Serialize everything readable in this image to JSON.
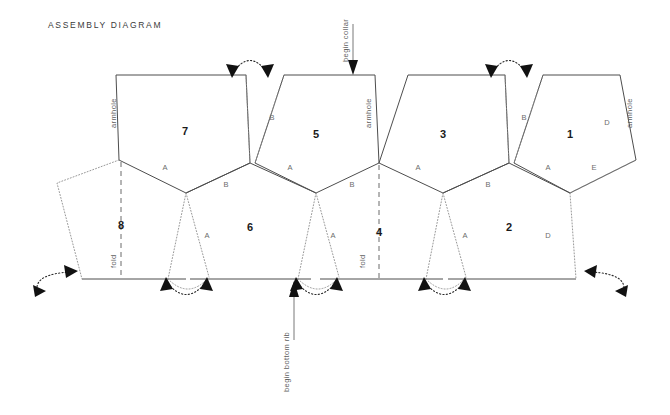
{
  "page": {
    "title": "ASSEMBLY DIAGRAM"
  },
  "colors": {
    "solid_edge": "#4d4d4d",
    "dotted_edge": "#8c8c8c",
    "fold_line": "#5a5a5a",
    "arrow": "#111111",
    "number_text": "#1a1a1a",
    "letter_text": "#6d6d6d",
    "annotation_text": "#5f5f5f",
    "background": "#ffffff"
  },
  "panels": [
    {
      "number": "1",
      "x": 570,
      "y": 135
    },
    {
      "number": "2",
      "x": 509,
      "y": 228
    },
    {
      "number": "3",
      "x": 443,
      "y": 135
    },
    {
      "number": "4",
      "x": 379,
      "y": 233
    },
    {
      "number": "5",
      "x": 316,
      "y": 135
    },
    {
      "number": "6",
      "x": 250,
      "y": 228
    },
    {
      "number": "7",
      "x": 185,
      "y": 132
    },
    {
      "number": "8",
      "x": 121,
      "y": 226
    }
  ],
  "edge_letters": [
    {
      "label": "A",
      "x": 165,
      "y": 168
    },
    {
      "label": "B",
      "x": 226,
      "y": 185
    },
    {
      "label": "A",
      "x": 207,
      "y": 236
    },
    {
      "label": "B",
      "x": 272,
      "y": 118
    },
    {
      "label": "A",
      "x": 290,
      "y": 168
    },
    {
      "label": "A",
      "x": 333,
      "y": 236
    },
    {
      "label": "B",
      "x": 352,
      "y": 185
    },
    {
      "label": "A",
      "x": 418,
      "y": 168
    },
    {
      "label": "B",
      "x": 488,
      "y": 185
    },
    {
      "label": "A",
      "x": 465,
      "y": 236
    },
    {
      "label": "B",
      "x": 524,
      "y": 118
    },
    {
      "label": "A",
      "x": 548,
      "y": 168
    },
    {
      "label": "E",
      "x": 594,
      "y": 168
    },
    {
      "label": "D",
      "x": 607,
      "y": 123
    },
    {
      "label": "D",
      "x": 548,
      "y": 236
    }
  ],
  "annotations": [
    {
      "name": "armhole-left",
      "label": "armhole",
      "x": 116,
      "y": 128,
      "rotation": -90
    },
    {
      "name": "armhole-center",
      "label": "armhole",
      "x": 371,
      "y": 128,
      "rotation": -90
    },
    {
      "name": "armhole-right",
      "label": "armhole",
      "x": 632,
      "y": 128,
      "rotation": -90
    },
    {
      "name": "fold-left",
      "label": "fold",
      "x": 116,
      "y": 266,
      "rotation": -90
    },
    {
      "name": "fold-center",
      "label": "fold",
      "x": 365,
      "y": 266,
      "rotation": -90
    },
    {
      "name": "begin-collar",
      "label": "begin collar",
      "x": 344,
      "y": 42,
      "rotation": -90
    },
    {
      "name": "begin-bottom-rib",
      "label": "begin bottom rib",
      "x": 289,
      "y": 360,
      "rotation": -90
    }
  ],
  "callouts": [
    {
      "name": "begin-collar-arrow",
      "direction": "down"
    },
    {
      "name": "begin-bottom-rib-arrow",
      "direction": "up"
    }
  ],
  "join_arcs": [
    {
      "name": "join-arc-top-left",
      "position": "top",
      "x": 250
    },
    {
      "name": "join-arc-top-right",
      "position": "top",
      "x": 509
    },
    {
      "name": "join-arc-bottom-1",
      "position": "bottom",
      "x": 185
    },
    {
      "name": "join-arc-bottom-2",
      "position": "bottom",
      "x": 316
    },
    {
      "name": "join-arc-bottom-3",
      "position": "bottom",
      "x": 443
    },
    {
      "name": "join-arc-side-left",
      "position": "left-edge"
    },
    {
      "name": "join-arc-side-right",
      "position": "right-edge"
    }
  ]
}
